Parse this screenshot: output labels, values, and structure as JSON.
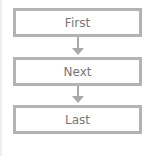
{
  "diagram": {
    "type": "flowchart",
    "nodes": [
      {
        "id": "first",
        "label": "First"
      },
      {
        "id": "next",
        "label": "Next"
      },
      {
        "id": "last",
        "label": "Last"
      }
    ],
    "edges": [
      {
        "from": "first",
        "to": "next"
      },
      {
        "from": "next",
        "to": "last"
      }
    ],
    "colors": {
      "border": "#b3b3b3",
      "arrow": "#a9a9a9",
      "text": "#777777"
    }
  }
}
